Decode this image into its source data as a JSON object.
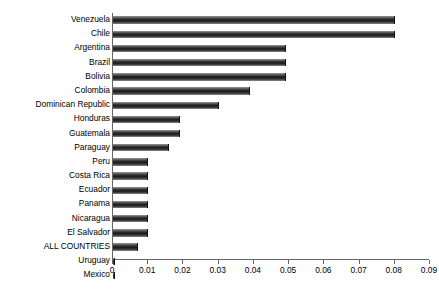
{
  "chart_data": {
    "type": "bar",
    "orientation": "horizontal",
    "title": "",
    "subtitle": "",
    "xlabel": "",
    "ylabel": "",
    "xlim": [
      0,
      0.09
    ],
    "ylim": null,
    "grid": false,
    "legend": null,
    "legend_position": "none",
    "xticks": [
      "0",
      "0.01",
      "0.02",
      "0.03",
      "0.04",
      "0.05",
      "0.06",
      "0.07",
      "0.08",
      "0.09"
    ],
    "xtick_values": [
      0,
      0.01,
      0.02,
      0.03,
      0.04,
      0.05,
      0.06,
      0.07,
      0.08,
      0.09
    ],
    "categories": [
      "Venezuela",
      "Chile",
      "Argentina",
      "Brazil",
      "Bolivia",
      "Colombia",
      "Dominican Republic",
      "Honduras",
      "Guatemala",
      "Paraguay",
      "Peru",
      "Costa Rica",
      "Ecuador",
      "Panama",
      "Nicaragua",
      "El Salvador",
      "ALL COUNTRIES",
      "Uruguay",
      "Mexico"
    ],
    "values": [
      0.08,
      0.08,
      0.049,
      0.049,
      0.049,
      0.039,
      0.03,
      0.019,
      0.019,
      0.016,
      0.01,
      0.01,
      0.01,
      0.01,
      0.01,
      0.01,
      0.007,
      0.0005,
      0.0005
    ],
    "bar_color": "#2b2b2b",
    "axis_color": "#666666",
    "background_color": "#ffffff"
  }
}
